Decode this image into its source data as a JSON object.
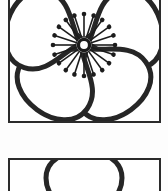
{
  "sheet": {
    "title": "Flower Motif Panels",
    "background_color": "#fdfdfd",
    "width": 168,
    "height": 191,
    "panel_count": 2
  },
  "palette": {
    "ink": "#2b2b2b",
    "outline": "#262626",
    "petal_fill_gray": "#8f8f8f",
    "paper_white": "#ffffff",
    "stamen": "#1c1c1c"
  },
  "panels": [
    {
      "id": "panel-flower",
      "name": "five-petal-flower-panel",
      "caption": "Five-petal flower with gray under-petals and radiating stamens",
      "frame": {
        "x": 8,
        "y": 0,
        "width": 153,
        "height": 123,
        "stroke": 2
      },
      "motif": {
        "type": "flower",
        "outer_petal_count": 5,
        "inner_petal_count": 5,
        "stamen_count": 20,
        "center": {
          "cx": 84,
          "cy": 45
        },
        "outer_petal_style": "white-filled-outlined-loop",
        "inner_petal_style": "gray-halftone-lobe",
        "center_style": "dark-ring-light-core"
      }
    },
    {
      "id": "panel-petal",
      "name": "petal-outline-panel",
      "caption": "Top arc of a single petal outline, cropped by sheet edge",
      "frame": {
        "x": 8,
        "y": 158,
        "width": 153,
        "height": 40,
        "stroke": 2
      },
      "motif": {
        "type": "petal-arc",
        "outer_petal_count": 1,
        "center": {
          "cx": 84,
          "cy": 215
        },
        "outer_petal_style": "white-filled-outlined-loop"
      }
    }
  ]
}
